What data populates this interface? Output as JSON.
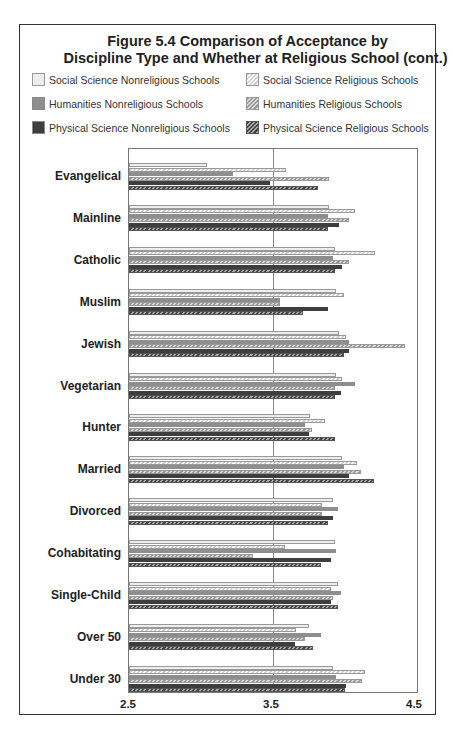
{
  "chart_data": {
    "type": "bar",
    "orientation": "horizontal",
    "title": "Figure 5.4 Comparison of Acceptance by",
    "subtitle": "Discipline Type and Whether at Religious School (cont.)",
    "xlabel": "",
    "ylabel": "",
    "xlim": [
      2.5,
      4.5
    ],
    "xticks": [
      "2.5",
      "3.5",
      "4.5"
    ],
    "reference_line": 3.5,
    "legend_position": "top",
    "categories": [
      "Evangelical",
      "Mainline",
      "Catholic",
      "Muslim",
      "Jewish",
      "Vegetarian",
      "Hunter",
      "Married",
      "Divorced",
      "Cohabitating",
      "Single-Child",
      "Over 50",
      "Under 30"
    ],
    "series": [
      {
        "name": "Social Science Nonreligious Schools",
        "style": "light-solid",
        "values": [
          3.04,
          3.89,
          3.93,
          3.94,
          3.96,
          3.94,
          3.76,
          3.98,
          3.92,
          3.93,
          3.95,
          3.75,
          3.92
        ]
      },
      {
        "name": "Social Science Religious Schools",
        "style": "light-hatched",
        "values": [
          3.59,
          4.07,
          4.21,
          3.99,
          4.01,
          3.98,
          3.86,
          4.08,
          3.84,
          3.58,
          3.9,
          3.66,
          4.14
        ]
      },
      {
        "name": "Humanities Nonreligious Schools",
        "style": "medium-solid",
        "values": [
          3.22,
          3.88,
          3.92,
          3.55,
          4.03,
          4.07,
          3.72,
          3.99,
          3.95,
          3.94,
          3.97,
          3.83,
          3.94
        ]
      },
      {
        "name": "Humanities Religious Schools",
        "style": "medium-hatched",
        "values": [
          3.89,
          4.03,
          4.03,
          3.55,
          4.42,
          3.93,
          3.77,
          4.11,
          3.84,
          3.36,
          3.92,
          3.72,
          4.12
        ]
      },
      {
        "name": "Physical Science Nonreligious Schools",
        "style": "dark-solid",
        "values": [
          3.48,
          3.96,
          3.98,
          3.88,
          4.03,
          3.97,
          3.75,
          4.03,
          3.92,
          3.9,
          3.9,
          3.65,
          4.01
        ]
      },
      {
        "name": "Physical Science Religious Schools",
        "style": "dark-hatched",
        "values": [
          3.81,
          3.88,
          3.93,
          3.71,
          3.99,
          3.93,
          3.93,
          4.2,
          3.88,
          3.83,
          3.95,
          3.78,
          4.0
        ]
      }
    ]
  },
  "legend": [
    "Social Science Nonreligious Schools",
    "Social Science Religious Schools",
    "Humanities Nonreligious Schools",
    "Humanities Religious Schools",
    "Physical Science Nonreligious Schools",
    "Physical Science Religious Schools"
  ]
}
